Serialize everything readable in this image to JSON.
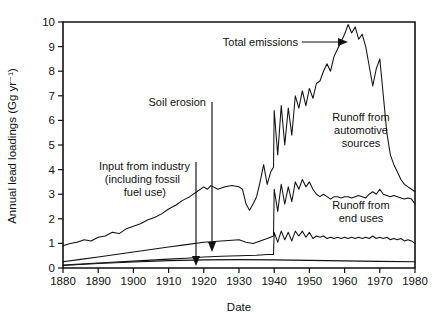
{
  "chart_data": {
    "type": "line",
    "title": "",
    "xlabel": "Date",
    "ylabel": "Annual lead loadings (Gg yr⁻¹)",
    "xlim": [
      1880,
      1980
    ],
    "ylim": [
      0,
      10
    ],
    "xticks": [
      1880,
      1890,
      1900,
      1910,
      1920,
      1930,
      1940,
      1950,
      1960,
      1970,
      1980
    ],
    "yticks": [
      0,
      1,
      2,
      3,
      4,
      5,
      6,
      7,
      8,
      9,
      10
    ],
    "grid": false,
    "legend_position": "in-plot annotations",
    "series": [
      {
        "name": "Total emissions",
        "x": [
          1880,
          1882,
          1884,
          1886,
          1888,
          1890,
          1892,
          1894,
          1896,
          1898,
          1900,
          1902,
          1904,
          1906,
          1908,
          1910,
          1912,
          1914,
          1916,
          1918,
          1920,
          1921,
          1922,
          1924,
          1926,
          1928,
          1930,
          1931,
          1932,
          1933,
          1934,
          1935,
          1936,
          1937,
          1938,
          1939,
          1939.8,
          1940,
          1941,
          1942,
          1943,
          1944,
          1945,
          1946,
          1947,
          1948,
          1949,
          1950,
          1951,
          1952,
          1953,
          1954,
          1955,
          1956,
          1957,
          1958,
          1959,
          1960,
          1961,
          1962,
          1963,
          1964,
          1965,
          1966,
          1967,
          1968,
          1969,
          1970,
          1971,
          1972,
          1973,
          1974,
          1975,
          1976,
          1977,
          1978,
          1979,
          1980
        ],
        "y": [
          0.9,
          1.0,
          1.05,
          1.15,
          1.1,
          1.25,
          1.3,
          1.45,
          1.4,
          1.6,
          1.7,
          1.8,
          1.95,
          2.05,
          2.2,
          2.4,
          2.55,
          2.75,
          2.9,
          3.1,
          3.3,
          3.2,
          3.35,
          3.2,
          3.3,
          3.35,
          3.3,
          3.2,
          2.6,
          2.35,
          2.6,
          2.9,
          3.5,
          4.2,
          3.4,
          3.9,
          4.1,
          6.4,
          4.6,
          6.6,
          5.0,
          6.5,
          5.4,
          7.0,
          6.5,
          7.2,
          6.6,
          7.3,
          6.9,
          7.5,
          7.6,
          8.0,
          8.3,
          8.0,
          8.6,
          8.9,
          9.2,
          9.5,
          9.9,
          9.55,
          9.8,
          9.3,
          9.5,
          9.0,
          8.2,
          7.4,
          8.1,
          8.5,
          7.0,
          5.5,
          4.6,
          4.2,
          3.9,
          3.6,
          3.4,
          3.3,
          3.2,
          3.1
        ],
        "description": "Uppermost curve, peaks near 9.9 Gg yr-1 around 1961"
      },
      {
        "name": "Runoff from automotive sources",
        "x": [
          1880,
          1885,
          1890,
          1895,
          1900,
          1905,
          1910,
          1915,
          1920,
          1925,
          1930,
          1932,
          1934,
          1936,
          1938,
          1939.8,
          1940,
          1941,
          1942,
          1943,
          1944,
          1945,
          1946,
          1947,
          1948,
          1949,
          1950,
          1951,
          1952,
          1953,
          1954,
          1955,
          1956,
          1957,
          1958,
          1959,
          1960,
          1961,
          1962,
          1963,
          1964,
          1965,
          1966,
          1967,
          1968,
          1969,
          1970,
          1971,
          1972,
          1973,
          1974,
          1975,
          1976,
          1977,
          1978,
          1979,
          1980
        ],
        "y": [
          0.25,
          0.35,
          0.45,
          0.55,
          0.65,
          0.75,
          0.85,
          0.95,
          1.05,
          1.1,
          1.15,
          1.05,
          1.0,
          1.1,
          1.2,
          1.3,
          3.2,
          2.3,
          3.4,
          2.6,
          3.3,
          2.7,
          3.5,
          3.2,
          3.6,
          3.3,
          3.5,
          3.2,
          3.0,
          2.9,
          3.0,
          2.9,
          2.8,
          2.9,
          2.9,
          2.85,
          2.9,
          2.9,
          2.85,
          2.9,
          2.95,
          2.9,
          2.85,
          3.0,
          3.1,
          3.0,
          3.2,
          3.0,
          2.95,
          2.9,
          2.95,
          2.9,
          2.85,
          2.8,
          2.85,
          2.8,
          2.6
        ],
        "description": "Middle curve, jumps sharply at 1940 then plateaus near 3"
      },
      {
        "name": "Runoff from end uses",
        "x": [
          1880,
          1885,
          1890,
          1895,
          1900,
          1905,
          1910,
          1915,
          1920,
          1925,
          1930,
          1935,
          1938,
          1939.8,
          1940,
          1941,
          1942,
          1943,
          1944,
          1945,
          1946,
          1947,
          1948,
          1949,
          1950,
          1951,
          1952,
          1953,
          1954,
          1955,
          1956,
          1957,
          1958,
          1959,
          1960,
          1961,
          1962,
          1963,
          1964,
          1965,
          1966,
          1967,
          1968,
          1969,
          1970,
          1971,
          1972,
          1973,
          1974,
          1975,
          1976,
          1977,
          1978,
          1979,
          1980
        ],
        "y": [
          0.12,
          0.16,
          0.2,
          0.24,
          0.28,
          0.32,
          0.36,
          0.4,
          0.45,
          0.48,
          0.5,
          0.52,
          0.55,
          0.55,
          1.45,
          1.05,
          1.5,
          1.15,
          1.45,
          1.1,
          1.5,
          1.3,
          1.5,
          1.25,
          1.45,
          1.2,
          1.3,
          1.25,
          1.3,
          1.2,
          1.25,
          1.2,
          1.25,
          1.2,
          1.25,
          1.2,
          1.25,
          1.2,
          1.25,
          1.2,
          1.25,
          1.2,
          1.3,
          1.2,
          1.25,
          1.2,
          1.25,
          1.15,
          1.2,
          1.15,
          1.2,
          1.1,
          1.15,
          1.1,
          1.0
        ],
        "description": "Lower curve, jumps at 1940 to about 1.4"
      },
      {
        "name": "Soil erosion",
        "x": [
          1880,
          1890,
          1900,
          1910,
          1920,
          1930,
          1940,
          1950,
          1960,
          1970,
          1980
        ],
        "y": [
          0.1,
          0.18,
          0.24,
          0.3,
          0.33,
          0.34,
          0.33,
          0.31,
          0.29,
          0.27,
          0.25
        ],
        "description": "Lowest, nearly flat curve along the baseline"
      }
    ],
    "annotations": [
      {
        "text": "Total emissions",
        "x": 1952,
        "y": 9.0,
        "arrow": "right"
      },
      {
        "text": "Soil erosion",
        "x": 1915,
        "y": 6.6,
        "arrow": "down"
      },
      {
        "text": "Input from industry",
        "x": 1906,
        "y": 4.1,
        "arrow": "down"
      },
      {
        "text": "(including fossil",
        "x": 1906,
        "y": 3.6,
        "arrow": "none"
      },
      {
        "text": "fuel use)",
        "x": 1906,
        "y": 3.1,
        "arrow": "none"
      },
      {
        "text": "Runoff from",
        "x": 1956,
        "y": 5.9,
        "arrow": "none"
      },
      {
        "text": "automotive",
        "x": 1956,
        "y": 5.35,
        "arrow": "none"
      },
      {
        "text": "sources",
        "x": 1956,
        "y": 4.8,
        "arrow": "none"
      },
      {
        "text": "Runoff from",
        "x": 1956,
        "y": 2.35,
        "arrow": "none"
      },
      {
        "text": "end uses",
        "x": 1956,
        "y": 1.85,
        "arrow": "none"
      }
    ]
  },
  "axis": {
    "ylabel": "Annual lead loadings (Gg yr⁻¹)",
    "xlabel": "Date",
    "yticks": [
      "10",
      "9",
      "8",
      "7",
      "6",
      "5",
      "4",
      "3",
      "2",
      "1",
      "0"
    ],
    "xticks": [
      "1880",
      "1890",
      "1900",
      "1910",
      "1920",
      "1930",
      "1940",
      "1950",
      "1960",
      "1970",
      "1980"
    ]
  },
  "annotations": {
    "total_emissions": "Total emissions",
    "soil_erosion": "Soil erosion",
    "industry_line1": "Input from industry",
    "industry_line2": "(including fossil",
    "industry_line3": "fuel use)",
    "automotive_line1": "Runoff from",
    "automotive_line2": "automotive",
    "automotive_line3": "sources",
    "enduses_line1": "Runoff from",
    "enduses_line2": "end uses"
  },
  "colors": {
    "line": "#111111",
    "background": "#ffffff",
    "text": "#111111"
  }
}
